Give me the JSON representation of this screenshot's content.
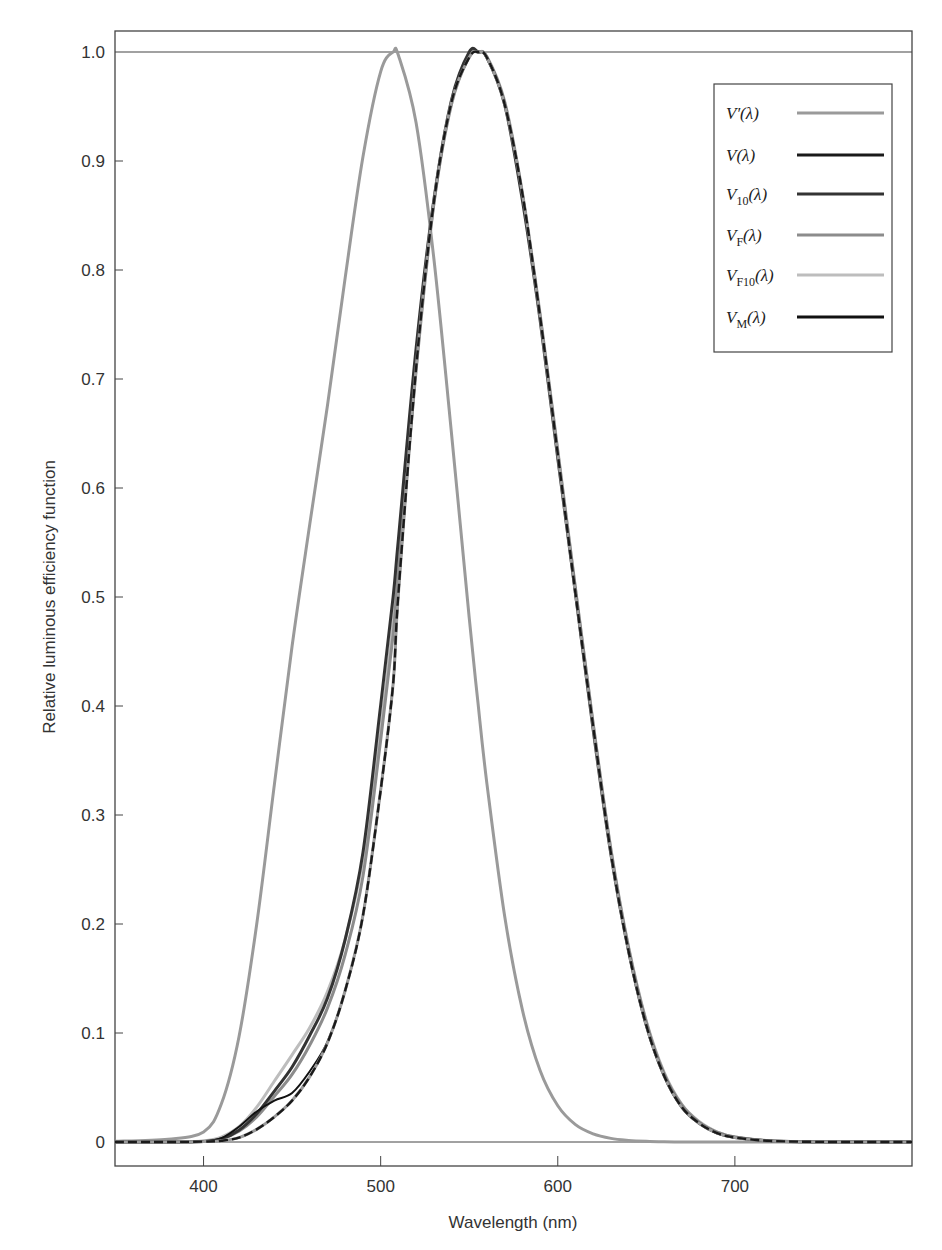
{
  "chart_data": {
    "type": "line",
    "title": "",
    "xlabel": "Wavelength (nm)",
    "ylabel": "Relative luminous efficiency function",
    "xlim": [
      350,
      800
    ],
    "ylim": [
      0,
      1.0
    ],
    "x_ticks": [
      400,
      500,
      600,
      700
    ],
    "y_ticks": [
      0,
      0.1,
      0.2,
      0.3,
      0.4,
      0.5,
      0.6,
      0.7,
      0.8,
      0.9,
      1.0
    ],
    "y_tick_labels": [
      "0",
      "0.1",
      "0.2",
      "0.3",
      "0.4",
      "0.5",
      "0.6",
      "0.7",
      "0.8",
      "0.9",
      "1.0"
    ],
    "grid": false,
    "legend_position": "upper right",
    "x": [
      350,
      380,
      400,
      410,
      420,
      430,
      440,
      450,
      460,
      470,
      480,
      490,
      500,
      507,
      510,
      520,
      530,
      540,
      550,
      555,
      560,
      570,
      580,
      590,
      600,
      610,
      620,
      630,
      640,
      650,
      660,
      670,
      680,
      690,
      700,
      720,
      750,
      800
    ],
    "series": [
      {
        "name": "V'(λ)",
        "label_base": "V",
        "label_sub": "",
        "label_prime": true,
        "color": "#9a9a9a",
        "width": 3,
        "values": [
          0.0006,
          0.0026,
          0.0093,
          0.0348,
          0.0966,
          0.1998,
          0.3281,
          0.455,
          0.567,
          0.676,
          0.793,
          0.904,
          0.982,
          1.0,
          0.997,
          0.935,
          0.811,
          0.65,
          0.481,
          0.402,
          0.3288,
          0.2076,
          0.1212,
          0.0655,
          0.0332,
          0.0159,
          0.0074,
          0.0033,
          0.0015,
          0.0007,
          0.0003,
          0.0001,
          0.0001,
          0,
          0,
          0,
          0,
          0
        ]
      },
      {
        "name": "V(λ)",
        "label_base": "V",
        "label_sub": "",
        "label_prime": false,
        "color": "#1a1a1a",
        "width": 3,
        "dashed": true,
        "values": [
          0,
          0,
          0.0004,
          0.0012,
          0.004,
          0.0116,
          0.023,
          0.038,
          0.06,
          0.091,
          0.139,
          0.208,
          0.323,
          0.42,
          0.503,
          0.71,
          0.862,
          0.954,
          0.995,
          1.0,
          0.995,
          0.952,
          0.87,
          0.757,
          0.631,
          0.503,
          0.381,
          0.265,
          0.175,
          0.107,
          0.061,
          0.032,
          0.017,
          0.0082,
          0.0041,
          0.001,
          0.0001,
          0
        ]
      },
      {
        "name": "V10(λ)",
        "label_base": "V",
        "label_sub": "10",
        "label_prime": false,
        "color": "#333333",
        "width": 3,
        "values": [
          0,
          0,
          0.0005,
          0.0028,
          0.0107,
          0.0259,
          0.0467,
          0.0688,
          0.0979,
          0.132,
          0.186,
          0.266,
          0.401,
          0.5,
          0.553,
          0.728,
          0.864,
          0.956,
          1.0,
          1.0,
          0.995,
          0.952,
          0.864,
          0.754,
          0.627,
          0.503,
          0.378,
          0.264,
          0.175,
          0.107,
          0.061,
          0.032,
          0.017,
          0.0082,
          0.0041,
          0.001,
          0.0001,
          0
        ]
      },
      {
        "name": "VF(λ)",
        "label_base": "V",
        "label_sub": "F",
        "label_prime": false,
        "color": "#8c8c8c",
        "width": 3,
        "values": [
          0,
          0,
          0.0006,
          0.003,
          0.01,
          0.023,
          0.042,
          0.062,
          0.089,
          0.123,
          0.172,
          0.244,
          0.369,
          0.465,
          0.523,
          0.708,
          0.86,
          0.952,
          0.996,
          1.0,
          0.995,
          0.954,
          0.869,
          0.758,
          0.633,
          0.507,
          0.383,
          0.268,
          0.178,
          0.11,
          0.063,
          0.034,
          0.018,
          0.009,
          0.0045,
          0.0011,
          0.0001,
          0
        ]
      },
      {
        "name": "VF10(λ)",
        "label_base": "V",
        "label_sub": "F10",
        "label_prime": false,
        "color": "#bdbdbd",
        "width": 3,
        "values": [
          0,
          0,
          0.001,
          0.0045,
          0.014,
          0.032,
          0.056,
          0.08,
          0.105,
          0.138,
          0.186,
          0.26,
          0.38,
          0.478,
          0.532,
          0.715,
          0.861,
          0.954,
          0.998,
          1.0,
          0.996,
          0.955,
          0.871,
          0.76,
          0.635,
          0.508,
          0.384,
          0.269,
          0.179,
          0.111,
          0.064,
          0.0345,
          0.0185,
          0.0092,
          0.0046,
          0.0011,
          0.0001,
          0
        ]
      },
      {
        "name": "VM(λ)",
        "label_base": "V",
        "label_sub": "M",
        "label_prime": false,
        "color": "#111111",
        "width": 2,
        "values": [
          0,
          0,
          0.0004,
          0.0035,
          0.014,
          0.028,
          0.038,
          0.045,
          0.065,
          0.092,
          0.139,
          0.208,
          0.323,
          0.42,
          0.503,
          0.71,
          0.862,
          0.954,
          0.995,
          1.0,
          0.995,
          0.952,
          0.87,
          0.757,
          0.631,
          0.503,
          0.381,
          0.265,
          0.175,
          0.107,
          0.061,
          0.032,
          0.017,
          0.0082,
          0.0041,
          0.001,
          0.0001,
          0
        ]
      }
    ]
  },
  "axes": {
    "xlabel": "Wavelength (nm)",
    "ylabel": "Relative luminous efficiency function",
    "x_tick_labels": [
      "400",
      "500",
      "600",
      "700"
    ],
    "y_tick_labels": [
      "0",
      "0.1",
      "0.2",
      "0.3",
      "0.4",
      "0.5",
      "0.6",
      "0.7",
      "0.8",
      "0.9",
      "1.0"
    ]
  }
}
